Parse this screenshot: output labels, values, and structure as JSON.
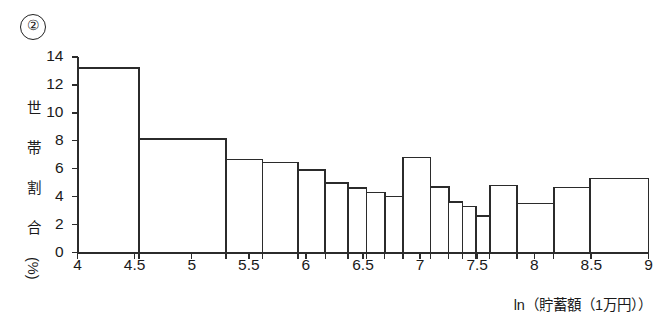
{
  "figure": {
    "number_label": "②",
    "ylabel_chars": [
      "世",
      "帯",
      "割",
      "合",
      "(%)"
    ],
    "xlabel": "ln（貯蓄額（1万円））"
  },
  "chart_data": {
    "type": "bar",
    "title": "",
    "subtitle": "",
    "xlabel": "ln（貯蓄額（1万円））",
    "ylabel": "世帯割合（%）",
    "xlim": [
      4,
      9
    ],
    "ylim": [
      0,
      14
    ],
    "grid": false,
    "legend": null,
    "xticks": [
      "4",
      "4.5",
      "5",
      "5.5",
      "6",
      "6.5",
      "7",
      "7.5",
      "8",
      "8.5",
      "9"
    ],
    "xtick_values": [
      4,
      4.5,
      5,
      5.5,
      6,
      6.5,
      7,
      7.5,
      8,
      8.5,
      9
    ],
    "yticks": [
      "0",
      "2",
      "4",
      "6",
      "8",
      "10",
      "12",
      "14"
    ],
    "ytick_values": [
      0,
      2,
      4,
      6,
      8,
      10,
      12,
      14
    ],
    "note": "Unequal-width histogram: bar heights are household percentage per bin.",
    "bins": [
      {
        "x0": 4.0,
        "x1": 4.54,
        "height": 13.2
      },
      {
        "x0": 4.54,
        "x1": 5.3,
        "height": 8.15
      },
      {
        "x0": 5.3,
        "x1": 5.62,
        "height": 6.65
      },
      {
        "x0": 5.62,
        "x1": 5.93,
        "height": 6.45
      },
      {
        "x0": 5.93,
        "x1": 6.17,
        "height": 5.9
      },
      {
        "x0": 6.17,
        "x1": 6.37,
        "height": 5.0
      },
      {
        "x0": 6.37,
        "x1": 6.53,
        "height": 4.6
      },
      {
        "x0": 6.53,
        "x1": 6.69,
        "height": 4.3
      },
      {
        "x0": 6.69,
        "x1": 6.85,
        "height": 4.0
      },
      {
        "x0": 6.85,
        "x1": 7.09,
        "height": 6.8
      },
      {
        "x0": 7.09,
        "x1": 7.25,
        "height": 4.7
      },
      {
        "x0": 7.25,
        "x1": 7.37,
        "height": 3.6
      },
      {
        "x0": 7.37,
        "x1": 7.49,
        "height": 3.3
      },
      {
        "x0": 7.49,
        "x1": 7.61,
        "height": 2.6
      },
      {
        "x0": 7.61,
        "x1": 7.85,
        "height": 4.8
      },
      {
        "x0": 7.85,
        "x1": 8.17,
        "height": 3.5
      },
      {
        "x0": 8.17,
        "x1": 8.49,
        "height": 4.65
      },
      {
        "x0": 8.49,
        "x1": 9.0,
        "height": 5.3
      }
    ]
  },
  "style": {
    "line_color": "#2b2b2b",
    "bar_fill": "#ffffff",
    "axis_color": "#2b2b2b"
  }
}
